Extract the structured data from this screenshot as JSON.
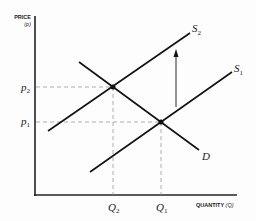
{
  "diagram": {
    "type": "supply-demand-shift",
    "y_axis": {
      "title": "PRICE",
      "symbol": "(p)"
    },
    "x_axis": {
      "title": "QUANTITY",
      "symbol": "(Q)"
    },
    "curves": [
      {
        "id": "S2",
        "label": "S",
        "sub": "2"
      },
      {
        "id": "S1",
        "label": "S",
        "sub": "1"
      },
      {
        "id": "D",
        "label": "D",
        "sub": ""
      }
    ],
    "price_levels": [
      {
        "label": "p",
        "sub": "2"
      },
      {
        "label": "p",
        "sub": "1"
      }
    ],
    "quantity_levels": [
      {
        "label": "Q",
        "sub": "2"
      },
      {
        "label": "Q",
        "sub": "1"
      }
    ],
    "annotation": "upward arrow: supply shifts from S1 to S2"
  }
}
